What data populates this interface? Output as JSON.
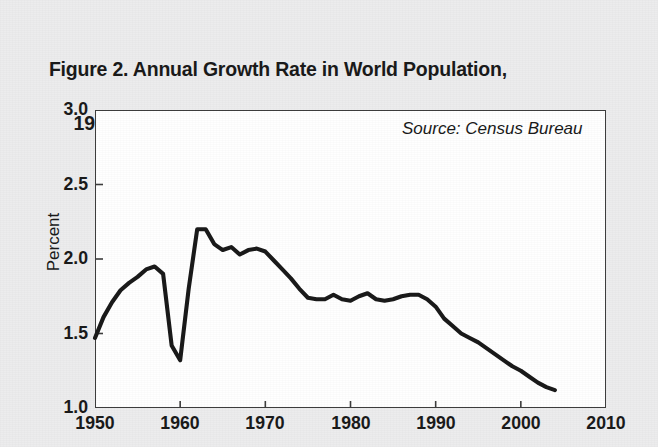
{
  "figure": {
    "title_line1": "Figure 2. Annual Growth Rate in World Population,",
    "title_line2": "1950–2004",
    "source_note": "Source: Census Bureau",
    "line_color": "#1a1a1a",
    "plot_background": "#ffffff",
    "page_background": "#ececed"
  },
  "chart_data": {
    "type": "line",
    "title": "Figure 2. Annual Growth Rate in World Population, 1950–2004",
    "subtitle": "",
    "xlabel": "",
    "ylabel": "Percent",
    "xlim": [
      1950,
      2010
    ],
    "ylim": [
      1.0,
      3.0
    ],
    "xticks": [
      1950,
      1960,
      1970,
      1980,
      1990,
      2000,
      2010
    ],
    "xticklabels": [
      "1950",
      "1960",
      "1970",
      "1980",
      "1990",
      "2000",
      "2010"
    ],
    "yticks": [
      1.0,
      1.5,
      2.0,
      2.5,
      3.0
    ],
    "yticklabels": [
      "1.0",
      "1.5",
      "2.0",
      "2.5",
      "3.0"
    ],
    "grid": false,
    "legend": false,
    "annotations": [
      {
        "text": "Source: Census Bureau",
        "x": 1988,
        "y": 2.82,
        "style": "italic"
      }
    ],
    "series": [
      {
        "name": "World population annual growth rate",
        "color": "#1a1a1a",
        "x": [
          1950,
          1951,
          1952,
          1953,
          1954,
          1955,
          1956,
          1957,
          1958,
          1959,
          1960,
          1961,
          1962,
          1963,
          1964,
          1965,
          1966,
          1967,
          1968,
          1969,
          1970,
          1971,
          1972,
          1973,
          1974,
          1975,
          1976,
          1977,
          1978,
          1979,
          1980,
          1981,
          1982,
          1983,
          1984,
          1985,
          1986,
          1987,
          1988,
          1989,
          1990,
          1991,
          1992,
          1993,
          1994,
          1995,
          1996,
          1997,
          1998,
          1999,
          2000,
          2001,
          2002,
          2003,
          2004
        ],
        "values": [
          1.47,
          1.61,
          1.71,
          1.79,
          1.84,
          1.88,
          1.93,
          1.95,
          1.9,
          1.42,
          1.32,
          1.8,
          2.2,
          2.2,
          2.1,
          2.06,
          2.08,
          2.03,
          2.06,
          2.07,
          2.05,
          1.99,
          1.93,
          1.87,
          1.8,
          1.74,
          1.73,
          1.73,
          1.76,
          1.73,
          1.72,
          1.75,
          1.77,
          1.73,
          1.72,
          1.73,
          1.75,
          1.76,
          1.76,
          1.73,
          1.68,
          1.6,
          1.55,
          1.5,
          1.47,
          1.44,
          1.4,
          1.36,
          1.32,
          1.28,
          1.25,
          1.21,
          1.17,
          1.14,
          1.12
        ]
      }
    ]
  },
  "axes": {
    "y_title": "Percent"
  }
}
